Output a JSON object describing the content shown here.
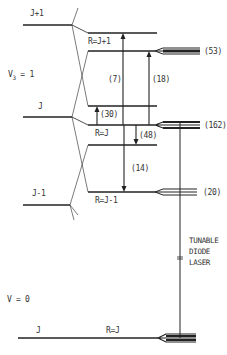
{
  "diagram": {
    "states": {
      "upper_vibrational": "V",
      "upper_vibrational_sub": "3",
      "upper_vibrational_eq": " = 1",
      "lower_vibrational": "V = 0"
    },
    "levels_left": {
      "j_plus_1": "J+1",
      "j": "J",
      "j_minus_1": "J-1",
      "ground_j": "J"
    },
    "levels_right": {
      "r_j_plus_1": "R=J+1",
      "r_j": "R=J",
      "r_j_minus_1": "R=J-1",
      "ground_r_j": "R=J"
    },
    "transitions": [
      {
        "label": "(7)",
        "from": "R=J+1 lower",
        "to": "R=J+1 upper",
        "direction": "up"
      },
      {
        "label": "(18)",
        "from": "R=J",
        "to": "R=J+1 lower",
        "direction": "up"
      },
      {
        "label": "(30)",
        "from": "R=J",
        "to": "R=J upper",
        "direction": "up"
      },
      {
        "label": "(48)",
        "from": "R=J",
        "to": "R=J lower",
        "direction": "down"
      },
      {
        "label": "(14)",
        "from": "R=J",
        "to": "R=J-1",
        "direction": "down"
      }
    ],
    "populations": {
      "p53": "(53)",
      "p162": "(162)",
      "p20": "(20)"
    },
    "laser": {
      "line1": "TUNABLE",
      "line2": "DIODE",
      "line3": "LASER"
    },
    "colors": {
      "ink": "#222222",
      "background": "#ffffff"
    }
  }
}
